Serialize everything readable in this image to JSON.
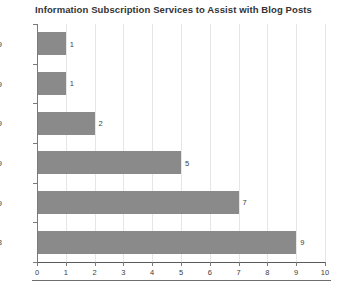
{
  "chart_data": {
    "type": "bar",
    "orientation": "horizontal",
    "title": "Information Subscription Services to Assist with Blog Posts",
    "xlabel": "",
    "ylabel": "",
    "categories": [
      "40-49",
      "30-39",
      "19-29",
      "19-29",
      "19-29",
      "13-18"
    ],
    "values": [
      1,
      1,
      2,
      5,
      7,
      9
    ],
    "data_labels": [
      "1",
      "1",
      "2",
      "5",
      "7",
      "9"
    ],
    "xlim": [
      0,
      10
    ],
    "xticks": [
      "0",
      "1",
      "2",
      "3",
      "4",
      "5",
      "6",
      "7",
      "8",
      "9",
      "10"
    ],
    "grid": "vertical",
    "legend": "none",
    "bar_color": "#8a8a8a",
    "gridline_color": "#e6e6e6",
    "axis_color": "#5a5a5a",
    "title_color": "#333333",
    "background": "#ffffff"
  }
}
